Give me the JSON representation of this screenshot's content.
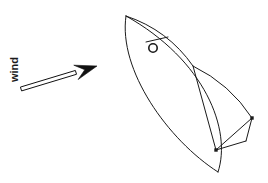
{
  "figure": {
    "type": "line-drawing",
    "background_color": "#ffffff",
    "stroke_color": "#1a1a1a",
    "stroke_width": 1,
    "width": 268,
    "height": 183
  },
  "annotations": {
    "wind_label": "wind",
    "wind_label_rotation_deg": -90
  },
  "wind_arrow": {
    "name": "wind direction arrow",
    "style": "outlined shaft with solid filled head",
    "tail": {
      "x": 21,
      "y": 89
    },
    "head": {
      "x": 97,
      "y": 66
    },
    "shaft_half_width": 2.0,
    "head_length": 22,
    "head_half_width": 7.5,
    "fill": "#111111",
    "stroke": "#111111"
  },
  "boat": {
    "name": "sailboat plan view",
    "hull": {
      "bow": {
        "x": 126,
        "y": 16
      },
      "stern": {
        "x": 218,
        "y": 172
      },
      "port_curve_control_1": {
        "x": 118,
        "y": 70
      },
      "port_curve_control_2": {
        "x": 168,
        "y": 140
      },
      "starboard_curve_control_1": {
        "x": 205,
        "y": 60
      },
      "starboard_curve_control_2": {
        "x": 232,
        "y": 130
      }
    },
    "mast": {
      "name": "mast",
      "shape": "circle",
      "center": {
        "x": 153,
        "y": 48
      },
      "radius": 4.2
    },
    "boom_line": {
      "start": {
        "x": 146,
        "y": 42
      },
      "end": {
        "x": 168,
        "y": 37
      }
    },
    "jib_sail": {
      "name": "jib",
      "tack": {
        "x": 126,
        "y": 16
      },
      "clew": {
        "x": 193,
        "y": 66
      },
      "belly_control": {
        "x": 168,
        "y": 30
      }
    },
    "main_sail": {
      "name": "mainsail",
      "head": {
        "x": 193,
        "y": 66
      },
      "clew": {
        "x": 252,
        "y": 118
      },
      "belly_control": {
        "x": 230,
        "y": 84
      }
    },
    "leech_line": {
      "start": {
        "x": 193,
        "y": 66
      },
      "end": {
        "x": 216,
        "y": 150
      }
    },
    "sheet_lines": [
      {
        "from": {
          "x": 252,
          "y": 118
        },
        "to": {
          "x": 216,
          "y": 150
        }
      },
      {
        "from": {
          "x": 216,
          "y": 150
        },
        "to": {
          "x": 246,
          "y": 141
        }
      },
      {
        "from": {
          "x": 246,
          "y": 141
        },
        "to": {
          "x": 252,
          "y": 118
        }
      }
    ],
    "fittings": [
      {
        "name": "clew fitting",
        "x": 252,
        "y": 118,
        "size": 3.4
      },
      {
        "name": "traveller fitting",
        "x": 216,
        "y": 150,
        "size": 3.4
      }
    ]
  }
}
